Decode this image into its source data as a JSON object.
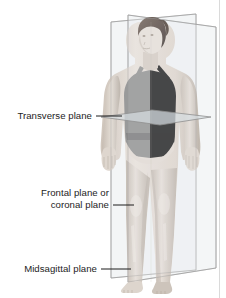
{
  "figure": {
    "type": "anatomical-planes-illustration",
    "background_color": "#ffffff",
    "border_rule_color": "#d8d8d8"
  },
  "labels": [
    {
      "id": "transverse",
      "text": "Transverse plane",
      "text_x": 92,
      "text_y": 119,
      "anchor": "end",
      "leader": {
        "x1": 96,
        "y1": 116,
        "x2": 122,
        "y2": 116
      }
    },
    {
      "id": "frontal",
      "text_line1": "Frontal plane or",
      "text_line2": "coronal plane",
      "text_x": 109,
      "text_y1": 196,
      "text_y2": 208,
      "anchor": "end",
      "leader": {
        "x1": 113,
        "y1": 205,
        "x2": 134,
        "y2": 205
      }
    },
    {
      "id": "midsagittal",
      "text": "Midsagittal plane",
      "text_x": 97,
      "text_y": 272,
      "anchor": "end",
      "leader": {
        "x1": 101,
        "y1": 269,
        "x2": 131,
        "y2": 269
      }
    }
  ],
  "planes": {
    "frontal": {
      "name": "Frontal plane or coronal plane",
      "outline_color": "#9a9a9a",
      "fill_color": "rgba(232,236,238,0.45)",
      "points": "111,22 196,14 196,270 111,278"
    },
    "midsagittal": {
      "name": "Midsagittal plane",
      "outline_color": "#9a9a9a",
      "fill_color": "rgba(236,239,240,0.42)",
      "points": "128,15 216,27 216,268 128,282"
    },
    "transverse": {
      "name": "Transverse plane",
      "outline_color": "#8f8f8f",
      "fill_color": "rgba(214,221,224,0.62)",
      "points": "101,117 152,110 211,117 160,125"
    }
  },
  "body": {
    "skin_light": "#e8e1da",
    "skin_mid": "#d4cbc2",
    "skin_shadow": "#b9afa5",
    "swimsuit_dark": "#1c1c1c",
    "swimsuit_gray": "#8d8d8d",
    "hair_color": "#5a4b42"
  }
}
